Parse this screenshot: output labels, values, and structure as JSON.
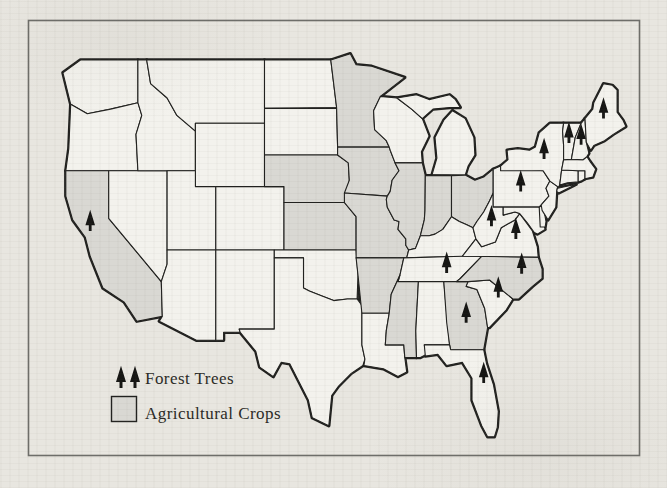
{
  "figure": {
    "legend": {
      "forest_label": "Forest Trees",
      "crops_label": "Agricultural Crops"
    },
    "forest_tree_states": [
      "California",
      "Maine",
      "Vermont",
      "New Hampshire",
      "New York",
      "Pennsylvania",
      "West Virginia",
      "Virginia",
      "Tennessee",
      "North Carolina",
      "South Carolina",
      "Georgia",
      "Florida"
    ],
    "agricultural_crop_states": [
      "California",
      "Minnesota",
      "Iowa",
      "Nebraska",
      "Kansas",
      "Missouri",
      "Illinois",
      "Indiana",
      "Ohio",
      "Arkansas",
      "Mississippi",
      "North Carolina",
      "Georgia"
    ],
    "colors": {
      "paper": "#e8e6e0",
      "state_fill": "#f3f2ed",
      "crops_fill": "#d9d8d3",
      "outline": "#21211f",
      "frame": "#6e6e6a",
      "tree": "#161614",
      "text": "#2b2a26"
    }
  }
}
